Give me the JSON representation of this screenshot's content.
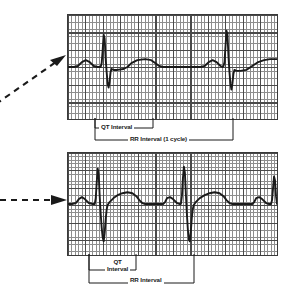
{
  "figure": {
    "background_color": "#ffffff",
    "trace_color": "#1a1a1a",
    "grid_fine_color": "#8e8e8e",
    "grid_bold_color": "#4a4a4a",
    "grid_border_color": "#3a3a3a"
  },
  "panels": [
    {
      "id": "top",
      "name": "normal-rate-ecg-strip",
      "pointer": {
        "style": "dashed-arrow",
        "direction": "up-right"
      },
      "calipers": [
        {
          "id": "qt-top",
          "label": "QT Interval",
          "label_lines": [
            "QT Interval"
          ],
          "measures": "QT interval"
        },
        {
          "id": "rr-top",
          "label": "RR Interval (1 cycle)",
          "label_lines": [
            "RR Interval (1 cycle)"
          ],
          "measures": "RR interval one cardiac cycle"
        }
      ]
    },
    {
      "id": "bottom",
      "name": "faster-rate-ecg-strip",
      "pointer": {
        "style": "dashed-arrow",
        "direction": "right"
      },
      "calipers": [
        {
          "id": "qt-bottom",
          "label": "QT Interval",
          "label_lines": [
            "QT",
            "Interval"
          ],
          "measures": "QT interval"
        },
        {
          "id": "rr-bottom",
          "label": "RR Interval",
          "label_lines": [
            "RR Interval"
          ],
          "measures": "RR interval"
        }
      ]
    }
  ],
  "chart_data": {
    "type": "line",
    "xlabel": "",
    "ylabel": "",
    "grid": true,
    "legend_position": "none",
    "axis_note": "Standard ECG graph paper: small square = 1 mm (0.04 s), bold square = 5 mm (0.20 s)",
    "series": [
      {
        "name": "ECG trace - top strip (slower rate)",
        "panel": "top",
        "baseline_y": 53,
        "xlim": [
          0,
          211
        ],
        "ylim": [
          0,
          106
        ],
        "beats": [
          {
            "beat": 1,
            "p_wave_peak_x": 18,
            "qrs_r_peak_x": 36,
            "qrs_s_trough_x": 42,
            "t_wave_peak_x": 72,
            "qt_end_x": 85
          },
          {
            "beat": 2,
            "p_wave_peak_x": 140,
            "qrs_r_peak_x": 158,
            "qrs_s_trough_x": 164,
            "t_wave_peak_x": 196,
            "qt_end_x": 211
          }
        ],
        "points": [
          [
            0,
            53
          ],
          [
            6,
            53
          ],
          [
            10,
            52
          ],
          [
            14,
            48
          ],
          [
            18,
            46
          ],
          [
            22,
            48
          ],
          [
            26,
            52
          ],
          [
            30,
            53
          ],
          [
            33,
            53
          ],
          [
            34,
            49
          ],
          [
            35,
            36
          ],
          [
            36,
            20
          ],
          [
            37,
            24
          ],
          [
            38,
            44
          ],
          [
            39,
            58
          ],
          [
            40,
            70
          ],
          [
            41,
            74
          ],
          [
            42,
            68
          ],
          [
            43,
            58
          ],
          [
            44,
            55
          ],
          [
            46,
            56
          ],
          [
            50,
            56
          ],
          [
            56,
            55
          ],
          [
            60,
            53
          ],
          [
            64,
            49
          ],
          [
            70,
            46
          ],
          [
            78,
            45
          ],
          [
            84,
            46
          ],
          [
            88,
            49
          ],
          [
            92,
            52
          ],
          [
            96,
            53
          ],
          [
            100,
            53
          ],
          [
            120,
            53
          ],
          [
            134,
            53
          ],
          [
            138,
            52
          ],
          [
            142,
            48
          ],
          [
            146,
            46
          ],
          [
            150,
            48
          ],
          [
            154,
            52
          ],
          [
            156,
            53
          ],
          [
            157,
            52
          ],
          [
            158,
            48
          ],
          [
            159,
            32
          ],
          [
            160,
            16
          ],
          [
            161,
            20
          ],
          [
            162,
            42
          ],
          [
            163,
            58
          ],
          [
            164,
            70
          ],
          [
            165,
            76
          ],
          [
            166,
            70
          ],
          [
            167,
            60
          ],
          [
            168,
            56
          ],
          [
            170,
            57
          ],
          [
            174,
            57
          ],
          [
            180,
            56
          ],
          [
            186,
            52
          ],
          [
            192,
            48
          ],
          [
            198,
            46
          ],
          [
            204,
            45
          ],
          [
            211,
            45
          ]
        ]
      },
      {
        "name": "ECG trace - bottom strip (faster rate)",
        "panel": "bottom",
        "baseline_y": 52,
        "xlim": [
          0,
          211
        ],
        "ylim": [
          0,
          104
        ],
        "beats": [
          {
            "beat": 1,
            "p_wave_peak_x": 14,
            "qrs_r_peak_x": 30,
            "qrs_s_trough_x": 36,
            "t_wave_peak_x": 60,
            "qt_end_x": 72
          },
          {
            "beat": 2,
            "p_wave_peak_x": 100,
            "qrs_r_peak_x": 116,
            "qrs_s_trough_x": 122,
            "t_wave_peak_x": 146,
            "qt_end_x": 158
          },
          {
            "beat": 3,
            "p_wave_peak_x": 190,
            "qrs_r_peak_x": 206,
            "qrs_s_trough_x": 211,
            "t_wave_peak_x": null,
            "qt_end_x": null
          }
        ],
        "points": [
          [
            0,
            52
          ],
          [
            4,
            52
          ],
          [
            8,
            51
          ],
          [
            11,
            47
          ],
          [
            14,
            45
          ],
          [
            17,
            47
          ],
          [
            21,
            51
          ],
          [
            25,
            52
          ],
          [
            27,
            52
          ],
          [
            28,
            46
          ],
          [
            29,
            30
          ],
          [
            30,
            16
          ],
          [
            31,
            22
          ],
          [
            32,
            44
          ],
          [
            33,
            62
          ],
          [
            34,
            76
          ],
          [
            35,
            86
          ],
          [
            36,
            90
          ],
          [
            37,
            82
          ],
          [
            38,
            68
          ],
          [
            39,
            58
          ],
          [
            40,
            53
          ],
          [
            42,
            50
          ],
          [
            46,
            46
          ],
          [
            50,
            43
          ],
          [
            55,
            41
          ],
          [
            60,
            40
          ],
          [
            65,
            41
          ],
          [
            69,
            44
          ],
          [
            72,
            48
          ],
          [
            75,
            51
          ],
          [
            78,
            52
          ],
          [
            84,
            52
          ],
          [
            92,
            52
          ],
          [
            96,
            52
          ],
          [
            98,
            50
          ],
          [
            100,
            46
          ],
          [
            103,
            45
          ],
          [
            106,
            47
          ],
          [
            110,
            51
          ],
          [
            113,
            52
          ],
          [
            114,
            52
          ],
          [
            115,
            44
          ],
          [
            116,
            26
          ],
          [
            117,
            14
          ],
          [
            118,
            20
          ],
          [
            119,
            42
          ],
          [
            120,
            62
          ],
          [
            121,
            78
          ],
          [
            122,
            88
          ],
          [
            123,
            90
          ],
          [
            124,
            80
          ],
          [
            125,
            66
          ],
          [
            126,
            57
          ],
          [
            127,
            53
          ],
          [
            129,
            50
          ],
          [
            133,
            46
          ],
          [
            138,
            43
          ],
          [
            143,
            41
          ],
          [
            148,
            40
          ],
          [
            153,
            41
          ],
          [
            157,
            44
          ],
          [
            160,
            48
          ],
          [
            163,
            51
          ],
          [
            166,
            52
          ],
          [
            172,
            52
          ],
          [
            182,
            52
          ],
          [
            186,
            52
          ],
          [
            188,
            50
          ],
          [
            190,
            46
          ],
          [
            193,
            45
          ],
          [
            196,
            47
          ],
          [
            200,
            51
          ],
          [
            203,
            52
          ],
          [
            205,
            52
          ],
          [
            206,
            48
          ],
          [
            207,
            36
          ],
          [
            208,
            24
          ],
          [
            209,
            28
          ],
          [
            210,
            44
          ],
          [
            211,
            52
          ]
        ]
      }
    ]
  }
}
